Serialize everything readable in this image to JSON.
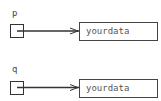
{
  "diagram": {
    "pointers": [
      {
        "label": "p",
        "target": "yourdata"
      },
      {
        "label": "q",
        "target": "yourdata"
      }
    ],
    "colors": {
      "line": "#333333",
      "background": "#ffffff",
      "text": "#555555"
    }
  }
}
